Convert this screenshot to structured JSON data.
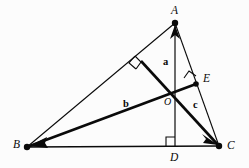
{
  "figure": {
    "name": "triangle-orthocenter-vector-diagram",
    "background_color": "#fcfcfc",
    "stroke_color": "#0a0a0a",
    "width": 249,
    "height": 168
  },
  "vertices": [
    {
      "id": "A",
      "label": "A",
      "x": 175,
      "y": 23,
      "label_x": 171,
      "label_y": 5
    },
    {
      "id": "B",
      "label": "B",
      "x": 27,
      "y": 147,
      "label_x": 13,
      "label_y": 139
    },
    {
      "id": "C",
      "label": "C",
      "x": 219,
      "y": 146,
      "label_x": 227,
      "label_y": 140
    },
    {
      "id": "D",
      "label": "D",
      "x": 175,
      "y": 146,
      "label_x": 170,
      "label_y": 152
    },
    {
      "id": "E",
      "label": "E",
      "x": 196,
      "y": 84,
      "label_x": 203,
      "label_y": 73
    },
    {
      "id": "O",
      "label": "O",
      "x": 175,
      "y": 88,
      "label_x": 164,
      "label_y": 97
    }
  ],
  "vectors": [
    {
      "id": "a",
      "label": "a",
      "from": "O",
      "to": "A",
      "label_x": 163,
      "label_y": 57
    },
    {
      "id": "b",
      "label": "b",
      "from": "O",
      "to": "B",
      "label_x": 123,
      "label_y": 99
    },
    {
      "id": "c",
      "label": "c",
      "from": "O",
      "to": "C",
      "label_x": 193,
      "label_y": 100
    }
  ],
  "right_angles": [
    {
      "id": "at-D",
      "at_vertex": "D",
      "description": "right angle between AD and BC"
    },
    {
      "id": "at-E",
      "at_vertex": "E",
      "description": "right angle between BE and AC"
    },
    {
      "id": "at-F",
      "at_vertex": "F",
      "description": "right angle between CF and AB"
    }
  ],
  "segments": [
    {
      "id": "AB",
      "from": "A",
      "to": "B",
      "style": "thin"
    },
    {
      "id": "BC",
      "from": "B",
      "to": "C",
      "style": "thin"
    },
    {
      "id": "AC",
      "from": "A",
      "to": "C",
      "style": "thin"
    },
    {
      "id": "AD",
      "from": "A",
      "to": "D",
      "style": "thin-altitude"
    },
    {
      "id": "BE",
      "from": "B",
      "to": "E",
      "style": "bold-altitude"
    },
    {
      "id": "CF",
      "from": "C",
      "to": "F",
      "style": "bold-altitude"
    }
  ]
}
